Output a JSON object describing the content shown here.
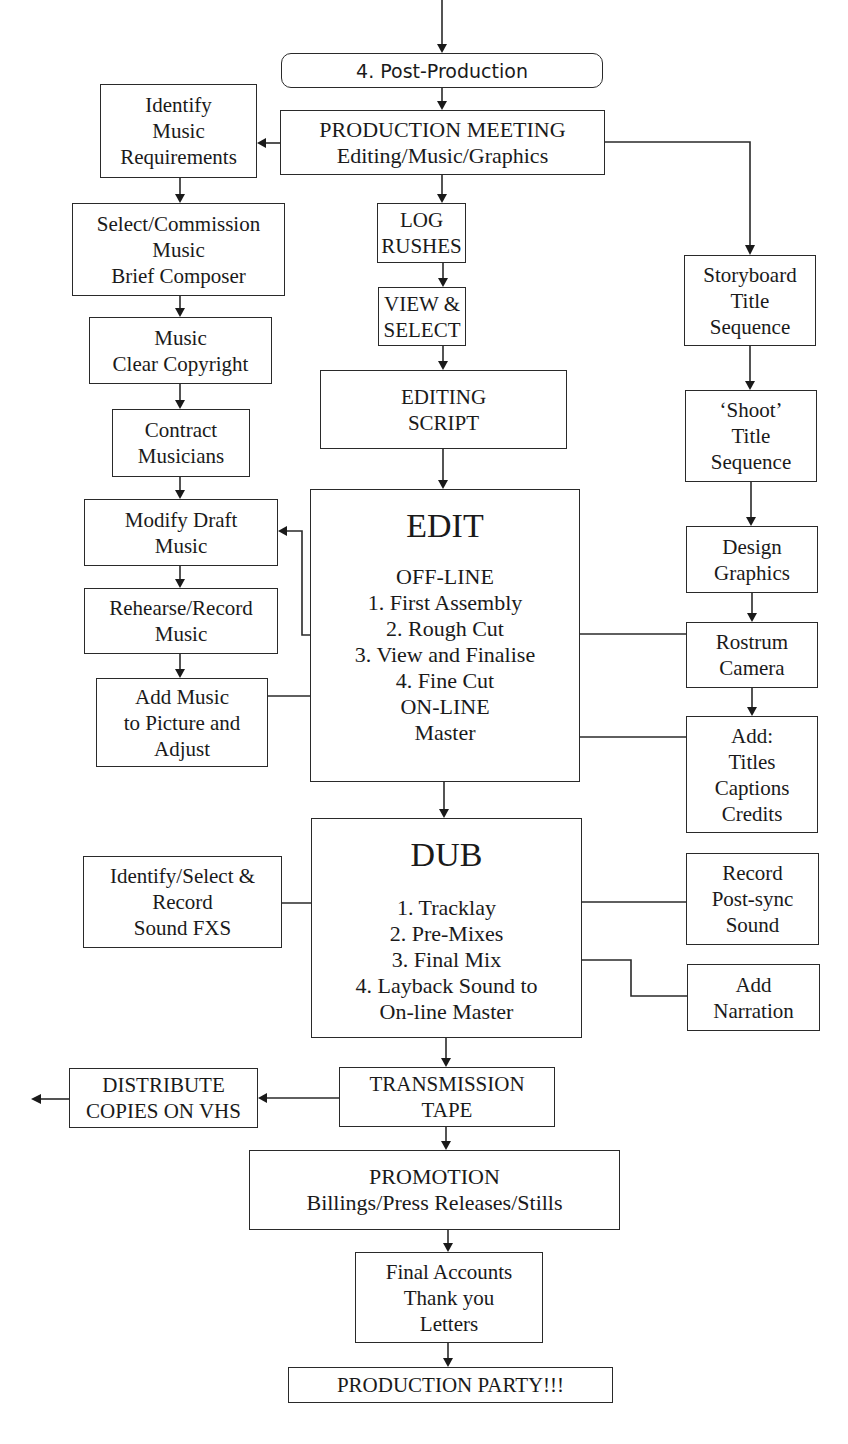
{
  "diagram": {
    "title": "4. Post-Production",
    "nodes": {
      "post_production": {
        "lines": [
          "4. Post-Production"
        ]
      },
      "production_meeting": {
        "lines": [
          "PRODUCTION MEETING",
          "Editing/Music/Graphics"
        ]
      },
      "identify_music": {
        "lines": [
          "Identify",
          "Music",
          "Requirements"
        ]
      },
      "select_commission": {
        "lines": [
          "Select/Commission",
          "Music",
          "Brief Composer"
        ]
      },
      "clear_copyright": {
        "lines": [
          "Music",
          "Clear Copyright"
        ]
      },
      "contract_musicians": {
        "lines": [
          "Contract",
          "Musicians"
        ]
      },
      "modify_draft": {
        "lines": [
          "Modify Draft",
          "Music"
        ]
      },
      "rehearse_record": {
        "lines": [
          "Rehearse/Record",
          "Music"
        ]
      },
      "add_music": {
        "lines": [
          "Add Music",
          "to Picture and",
          "Adjust"
        ]
      },
      "log_rushes": {
        "lines": [
          "LOG",
          "RUSHES"
        ]
      },
      "view_select": {
        "lines": [
          "VIEW &",
          "SELECT"
        ]
      },
      "editing_script": {
        "lines": [
          "EDITING",
          "SCRIPT"
        ]
      },
      "edit": {
        "heading": "EDIT",
        "lines": [
          "OFF-LINE",
          "1. First Assembly",
          "2. Rough Cut",
          "3. View and Finalise",
          "4. Fine Cut",
          "ON-LINE",
          "Master"
        ]
      },
      "storyboard": {
        "lines": [
          "Storyboard",
          "Title",
          "Sequence"
        ]
      },
      "shoot": {
        "lines": [
          "‘Shoot’",
          "Title",
          "Sequence"
        ]
      },
      "design_graphics": {
        "lines": [
          "Design",
          "Graphics"
        ]
      },
      "rostrum_camera": {
        "lines": [
          "Rostrum",
          "Camera"
        ]
      },
      "add_titles": {
        "lines": [
          "Add:",
          "Titles",
          "Captions",
          "Credits"
        ]
      },
      "dub": {
        "heading": "DUB",
        "lines": [
          "1. Tracklay",
          "2. Pre-Mixes",
          "3. Final Mix",
          "4. Layback Sound to",
          "On-line Master"
        ]
      },
      "sound_fxs": {
        "lines": [
          "Identify/Select &",
          "Record",
          "Sound FXS"
        ]
      },
      "post_sync": {
        "lines": [
          "Record",
          "Post-sync",
          "Sound"
        ]
      },
      "narration": {
        "lines": [
          "Add",
          "Narration"
        ]
      },
      "transmission_tape": {
        "lines": [
          "TRANSMISSION",
          "TAPE"
        ]
      },
      "distribute": {
        "lines": [
          "DISTRIBUTE",
          "COPIES ON VHS"
        ]
      },
      "promotion": {
        "lines": [
          "PROMOTION",
          "Billings/Press Releases/Stills"
        ]
      },
      "final_accounts": {
        "lines": [
          "Final Accounts",
          "Thank you",
          "Letters"
        ]
      },
      "production_party": {
        "lines": [
          "PRODUCTION PARTY!!!"
        ]
      }
    }
  }
}
